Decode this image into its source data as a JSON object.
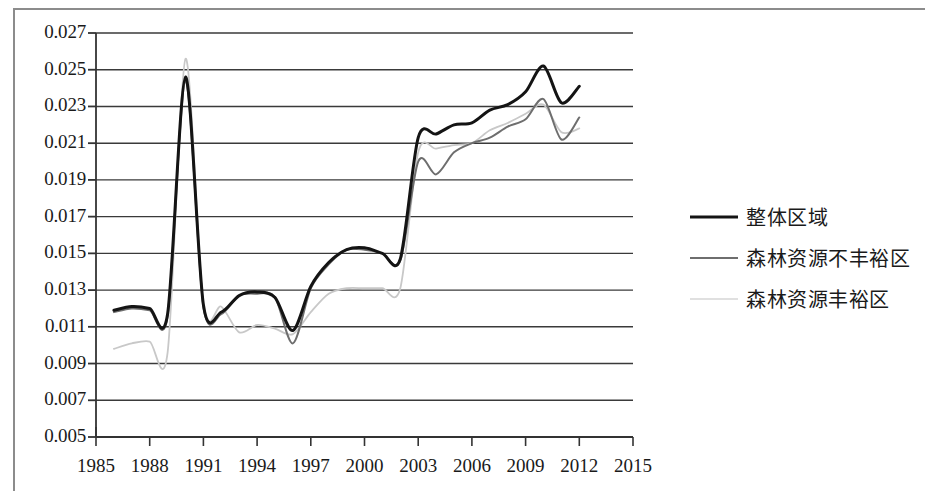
{
  "chart_data": {
    "type": "line",
    "title": "",
    "subtitle": "",
    "xlabel": "",
    "ylabel": "",
    "grid": true,
    "legend_position": "right",
    "xlim": [
      1985,
      2015
    ],
    "ylim": [
      0.005,
      0.027
    ],
    "x_tick_labels": [
      "1985",
      "1988",
      "1991",
      "1994",
      "1997",
      "2000",
      "2003",
      "2006",
      "2009",
      "2012",
      "2015"
    ],
    "x_ticks": [
      1985,
      1988,
      1991,
      1994,
      1997,
      2000,
      2003,
      2006,
      2009,
      2012,
      2015
    ],
    "y_tick_labels": [
      "0.027",
      "0.025",
      "0.023",
      "0.021",
      "0.019",
      "0.017",
      "0.015",
      "0.013",
      "0.011",
      "0.009",
      "0.007",
      "0.005"
    ],
    "y_ticks": [
      0.027,
      0.025,
      0.023,
      0.021,
      0.019,
      0.017,
      0.015,
      0.013,
      0.011,
      0.009,
      0.007,
      0.005
    ],
    "x": [
      1986,
      1987,
      1988,
      1989,
      1990,
      1991,
      1992,
      1993,
      1994,
      1995,
      1996,
      1997,
      1998,
      1999,
      2000,
      2001,
      2002,
      2003,
      2004,
      2005,
      2006,
      2007,
      2008,
      2009,
      2010,
      2011,
      2012
    ],
    "series": [
      {
        "name": "整体区域",
        "color": "#141414",
        "width": 3,
        "values": [
          0.0119,
          0.0121,
          0.012,
          0.0117,
          0.0246,
          0.0122,
          0.0118,
          0.0127,
          0.0129,
          0.0126,
          0.0108,
          0.0132,
          0.0145,
          0.0152,
          0.0153,
          0.015,
          0.0147,
          0.0213,
          0.0215,
          0.022,
          0.0221,
          0.0228,
          0.0231,
          0.0238,
          0.0252,
          0.0232,
          0.0241
        ]
      },
      {
        "name": "森林资源不丰裕区",
        "color": "#6e6e6e",
        "width": 2,
        "values": [
          0.0118,
          0.012,
          0.0119,
          0.0116,
          0.0244,
          0.0121,
          0.0117,
          0.0127,
          0.0128,
          0.0126,
          0.0101,
          0.0131,
          0.0144,
          0.0152,
          0.0152,
          0.015,
          0.0146,
          0.02,
          0.0193,
          0.0205,
          0.021,
          0.0213,
          0.0219,
          0.0223,
          0.0234,
          0.0212,
          0.0224
        ]
      },
      {
        "name": "森林资源丰裕区",
        "color": "#c8c8c8",
        "width": 1.8,
        "values": [
          0.0098,
          0.0101,
          0.0102,
          0.0096,
          0.0256,
          0.0121,
          0.0121,
          0.0107,
          0.0111,
          0.0109,
          0.0106,
          0.0118,
          0.0128,
          0.0131,
          0.0131,
          0.0131,
          0.0131,
          0.0205,
          0.0207,
          0.0209,
          0.021,
          0.0217,
          0.0221,
          0.0226,
          0.0231,
          0.0216,
          0.0218
        ]
      }
    ]
  },
  "legend": {
    "items": [
      {
        "label": "整体区域",
        "swatch": "sw-overall"
      },
      {
        "label": "森林资源不丰裕区",
        "swatch": "sw-poor"
      },
      {
        "label": "森林资源丰裕区",
        "swatch": "sw-rich"
      }
    ]
  },
  "axes": {
    "axis_color": "#333333",
    "grid_color": "#3a3a3a",
    "frame_color": "#8c8c8c"
  }
}
